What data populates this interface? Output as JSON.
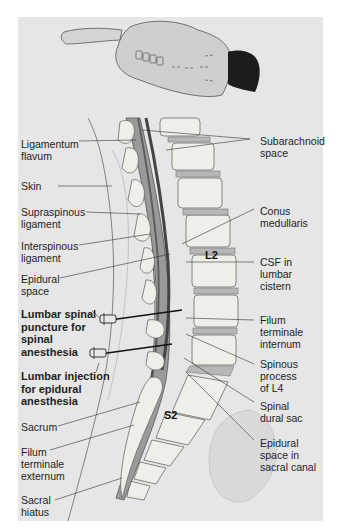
{
  "figure": {
    "patient_position": "Lateral decubitus, flexed (fetal) position",
    "colors": {
      "panel_background": "#e6e6e6",
      "bone": "#efefea",
      "disc": "#b9b9b9",
      "dura": "#6e6e6e",
      "csf": "#9a9a9a",
      "outline": "#5a5a5a"
    }
  },
  "labels_left": [
    {
      "id": "ligamentum-flavum",
      "text": "Ligamentum\nflavum"
    },
    {
      "id": "skin",
      "text": "Skin"
    },
    {
      "id": "supraspinous-ligament",
      "text": "Supraspinous\nligament"
    },
    {
      "id": "interspinous-ligament",
      "text": "Interspinous\nligament"
    },
    {
      "id": "epidural-space",
      "text": "Epidural\nspace"
    },
    {
      "id": "lumbar-spinal-puncture",
      "text": "Lumbar spinal\npuncture for\nspinal\nanesthesia",
      "bold": true
    },
    {
      "id": "lumbar-injection-epidural",
      "text": "Lumbar injection\nfor epidural\nanesthesia",
      "bold": true
    },
    {
      "id": "sacrum",
      "text": "Sacrum"
    },
    {
      "id": "filum-terminale-externum",
      "text": "Filum\nterminale\nexternum"
    },
    {
      "id": "sacral-hiatus",
      "text": "Sacral\nhiatus"
    }
  ],
  "labels_right": [
    {
      "id": "subarachnoid-space",
      "text": "Subarachnoid\nspace"
    },
    {
      "id": "conus-medullaris",
      "text": "Conus\nmedullaris"
    },
    {
      "id": "csf-lumbar-cistern",
      "text": "CSF in\nlumbar\ncistern"
    },
    {
      "id": "filum-terminale-internum",
      "text": "Filum\nterminale\ninternum"
    },
    {
      "id": "spinous-process-l4",
      "text": "Spinous\nprocess\nof L4"
    },
    {
      "id": "spinal-dural-sac",
      "text": "Spinal\ndural sac"
    },
    {
      "id": "epidural-space-sacral-canal",
      "text": "Epidural\nspace in\nsacral canal"
    }
  ],
  "vertebra_labels": {
    "l2": "L2",
    "s2": "S2"
  }
}
